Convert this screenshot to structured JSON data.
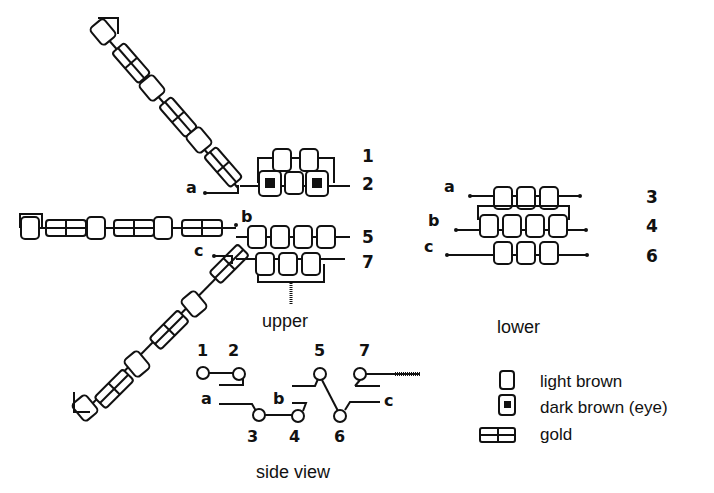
{
  "diagram": {
    "row_labels_upper": [
      "1",
      "2",
      "5",
      "7"
    ],
    "row_labels_lower": [
      "3",
      "4",
      "6"
    ],
    "strand_labels": [
      "a",
      "b",
      "c"
    ],
    "captions": {
      "upper": "upper",
      "lower": "lower",
      "side_view": "side view"
    },
    "side_view_labels": {
      "n1": "1",
      "n2": "2",
      "n3": "3",
      "n4": "4",
      "n5": "5",
      "n6": "6",
      "n7": "7",
      "a": "a",
      "b": "b",
      "c": "c"
    },
    "legend": [
      {
        "symbol": "light-brown-bead",
        "label": "light brown"
      },
      {
        "symbol": "dark-brown-eye-bead",
        "label": "dark brown (eye)"
      },
      {
        "symbol": "gold-bead",
        "label": "gold"
      }
    ],
    "colors": {
      "ink": "#111111",
      "background": "#ffffff"
    }
  }
}
